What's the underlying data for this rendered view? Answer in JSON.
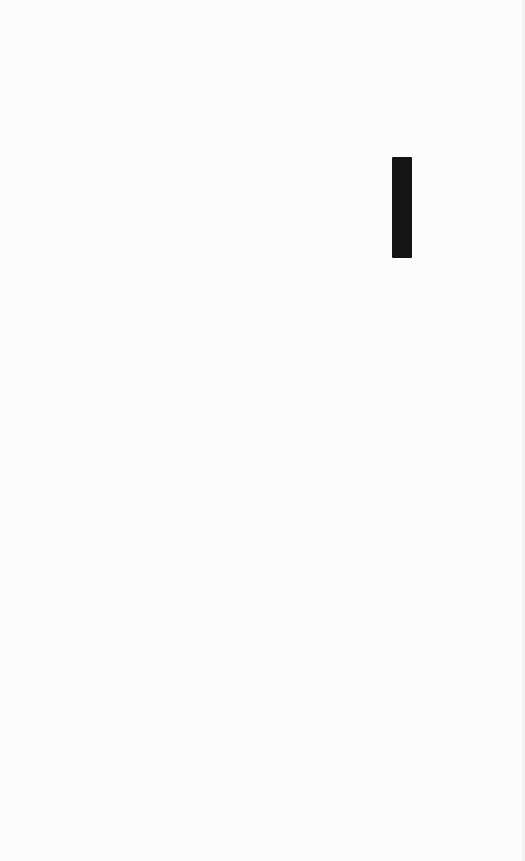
{
  "page": {
    "background_color": "#fcfcfc",
    "edge_color": "#f3f3f3"
  },
  "caret": {
    "color": "#141414",
    "x": 392,
    "y": 157,
    "width": 20,
    "height": 101
  }
}
